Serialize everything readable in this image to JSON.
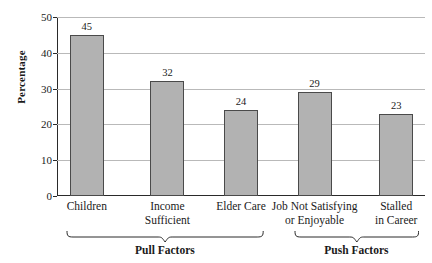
{
  "chart_data": {
    "type": "bar",
    "title": "",
    "xlabel": "",
    "ylabel": "Percentage",
    "categories": [
      "Children",
      "Income Sufficient",
      "Elder Care",
      "Job Not Satisfying or Enjoyable",
      "Stalled in Career"
    ],
    "category_lines": [
      [
        "Children"
      ],
      [
        "Income",
        "Sufficient"
      ],
      [
        "Elder Care"
      ],
      [
        "Job Not Satisfying",
        "or Enjoyable"
      ],
      [
        "Stalled",
        "in Career"
      ]
    ],
    "values": [
      45,
      32,
      24,
      29,
      23
    ],
    "value_labels": [
      "45",
      "32",
      "24",
      "29",
      "23"
    ],
    "ylim": [
      0,
      50
    ],
    "yticks": [
      0,
      10,
      20,
      30,
      40,
      50
    ],
    "ytick_labels": [
      "0",
      "10",
      "20",
      "30",
      "40",
      "50"
    ],
    "grid": true,
    "legend": "none",
    "groups": [
      {
        "label": "Pull Factors",
        "members": [
          0,
          1,
          2
        ]
      },
      {
        "label": "Push Factors",
        "members": [
          3,
          4
        ]
      }
    ],
    "colors": {
      "bar_fill": "#b2b2b2",
      "bar_border": "#4a4a4a",
      "gridline": "#b9b9b9",
      "axis": "#2a2a2a",
      "text": "#1a1a1a",
      "background": "#ffffff"
    }
  }
}
